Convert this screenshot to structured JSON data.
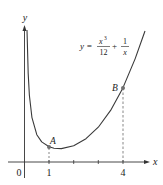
{
  "diagram": {
    "equation": {
      "lhs": "y =",
      "term1_num": "x",
      "term1_exp": "3",
      "term1_den": "12",
      "plus": "+",
      "term2_num": "1",
      "term2_den": "x"
    },
    "axes": {
      "x_label": "x",
      "y_label": "y",
      "origin_label": "0",
      "x_ticks": [
        "1",
        "4"
      ]
    },
    "points": [
      {
        "label": "A",
        "x": 1,
        "y": 1.083
      },
      {
        "label": "B",
        "x": 4,
        "y": 5.583
      }
    ],
    "colors": {
      "curve": "#3a3a3a",
      "point": "#707070",
      "axis": "#333333"
    }
  }
}
